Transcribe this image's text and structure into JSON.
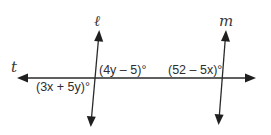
{
  "diagram": {
    "lines": {
      "transversal": {
        "label": "t"
      },
      "left": {
        "label": "ℓ"
      },
      "right": {
        "label": "m"
      }
    },
    "angles": {
      "left_lower_left": "(3x + 5y)°",
      "left_upper_right": "(4y – 5)°",
      "right_upper_left": "(52 – 5x)°"
    },
    "colors": {
      "line": "#2a2a2a",
      "text": "#2e2e2e",
      "background": "#ffffff"
    }
  }
}
